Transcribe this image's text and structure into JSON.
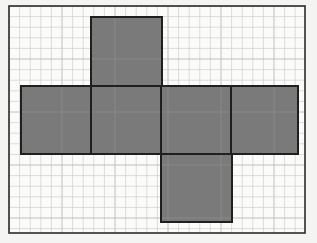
{
  "document": {
    "title": "Cube net on graph paper",
    "figure_type": "geometry-net"
  },
  "canvas": {
    "width": 317,
    "height": 243,
    "background_color": "#f4f4f2",
    "paper_color": "#fbfbfa"
  },
  "frame": {
    "label": "outer-border",
    "x": 9,
    "y": 6,
    "width": 296,
    "height": 227,
    "stroke_color": "#2b2b2b",
    "stroke_width": 1.6,
    "fill_color": "#fbfbfa"
  },
  "graph_paper": {
    "label": "grid",
    "cell_size": 10.6,
    "minor_line_color": "#cfcfcf",
    "minor_line_width": 0.7,
    "major_line_color": "#b9b9b9",
    "major_line_width": 0.9,
    "major_every": 5,
    "columns": 28,
    "rows": 21
  },
  "net": {
    "label": "cube-net",
    "shape_name": "net of a cube",
    "face_count": 6,
    "fill_color": "#7a7a7a",
    "stroke_color": "#1f1f1f",
    "stroke_width": 2,
    "interior_grid_color": "#8a8a8a",
    "faces": [
      {
        "id": "face-top",
        "position": "top",
        "x": 91,
        "y": 17,
        "width": 71,
        "height": 69
      },
      {
        "id": "face-left",
        "position": "row-left",
        "x": 21,
        "y": 86,
        "width": 70,
        "height": 68
      },
      {
        "id": "face-front",
        "position": "row-second",
        "x": 91,
        "y": 86,
        "width": 70,
        "height": 68
      },
      {
        "id": "face-right",
        "position": "row-third",
        "x": 161,
        "y": 86,
        "width": 70,
        "height": 68
      },
      {
        "id": "face-back",
        "position": "row-fourth",
        "x": 231,
        "y": 86,
        "width": 67,
        "height": 68
      },
      {
        "id": "face-bottom",
        "position": "bottom",
        "x": 161,
        "y": 154,
        "width": 71,
        "height": 68
      }
    ]
  },
  "chart_data": {
    "type": "diagram",
    "row_of_four_squares": 4,
    "square_above_index": 2,
    "square_below_index": 3,
    "square_side_cells": 6.5
  }
}
